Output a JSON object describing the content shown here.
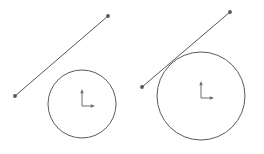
{
  "scene": {
    "title": "Two circle-and-line geometry figures",
    "width": 264,
    "height": 154,
    "background_color": "#ffffff",
    "stroke_color": "#5a5a5a",
    "line_stroke_color": "#555555",
    "axis_color": "#6b6b6b",
    "stroke_width": 1,
    "figures": [
      {
        "name": "left-figure",
        "label": "non-intersecting line and circle",
        "circle": {
          "cx": 82,
          "cy": 104,
          "r": 34
        },
        "line": {
          "x1": 15,
          "y1": 96,
          "x2": 108,
          "y2": 16
        },
        "endpoints": [
          {
            "x": 15,
            "y": 96,
            "r": 1.9
          },
          {
            "x": 108,
            "y": 16,
            "r": 1.9
          }
        ],
        "axis_marker": {
          "ox": 82,
          "oy": 106,
          "up_length": 17,
          "right_length": 13
        }
      },
      {
        "name": "right-figure",
        "label": "tangent line and circle",
        "circle": {
          "cx": 201,
          "cy": 96,
          "r": 44
        },
        "line": {
          "x1": 142,
          "y1": 87,
          "x2": 230,
          "y2": 12
        },
        "endpoints": [
          {
            "x": 142,
            "y": 87,
            "r": 1.9
          },
          {
            "x": 230,
            "y": 12,
            "r": 1.9
          }
        ],
        "axis_marker": {
          "ox": 201,
          "oy": 98,
          "up_length": 17,
          "right_length": 13
        }
      }
    ]
  }
}
